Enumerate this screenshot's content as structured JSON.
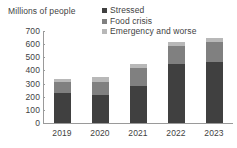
{
  "chart_data": {
    "type": "bar",
    "stacked": true,
    "title": "",
    "ylabel": "Millions of people",
    "xlabel": "",
    "categories": [
      "2019",
      "2020",
      "2021",
      "2022",
      "2023"
    ],
    "ylim": [
      0,
      700
    ],
    "ytick_values": [
      0,
      100,
      200,
      300,
      400,
      500,
      600,
      700
    ],
    "ytick_labels": [
      "0",
      "100",
      "200",
      "300",
      "400",
      "500",
      "600",
      "700"
    ],
    "grid": false,
    "legend_position": "top-right",
    "series": [
      {
        "name": "Stressed",
        "color": "#404040",
        "values": [
          230,
          215,
          280,
          450,
          465
        ]
      },
      {
        "name": "Food crisis",
        "color": "#808080",
        "values": [
          85,
          100,
          140,
          135,
          150
        ]
      },
      {
        "name": "Emergency and worse",
        "color": "#b8b8b8",
        "values": [
          20,
          35,
          30,
          30,
          30
        ]
      }
    ],
    "totals": [
      335,
      350,
      450,
      615,
      645
    ]
  },
  "axis": {
    "line_color": "#9a9a9a",
    "text_color": "#3f3f3f"
  }
}
